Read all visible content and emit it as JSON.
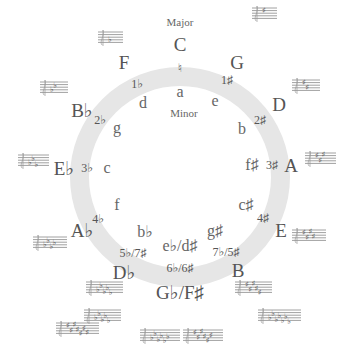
{
  "diagram": {
    "captions": {
      "major": "Major",
      "minor": "Minor"
    },
    "ring": {
      "color": "#e6e6e6",
      "cx": 180,
      "cy": 177,
      "r_outer": 110,
      "r_inner": 91
    },
    "keys": [
      {
        "id": "C",
        "major": "C",
        "minor": "a",
        "signature": "♮",
        "major_pos": [
          180,
          44
        ],
        "minor_pos": [
          180,
          92
        ],
        "sig_pos": [
          180,
          68
        ],
        "staff_pos": null,
        "accidentals": 0,
        "type": "natural"
      },
      {
        "id": "G",
        "major": "G",
        "minor": "e",
        "signature": "1♯",
        "major_pos": [
          237,
          62
        ],
        "minor_pos": [
          215,
          101
        ],
        "sig_pos": [
          227,
          80
        ],
        "staff_pos": [
          252,
          8
        ],
        "accidentals": 1,
        "type": "sharp"
      },
      {
        "id": "D",
        "major": "D",
        "minor": "b",
        "signature": "2♯",
        "major_pos": [
          279,
          104
        ],
        "minor_pos": [
          242,
          129
        ],
        "sig_pos": [
          260,
          120
        ],
        "staff_pos": [
          292,
          80
        ],
        "accidentals": 2,
        "type": "sharp"
      },
      {
        "id": "A",
        "major": "A",
        "minor": "f♯",
        "signature": "3♯",
        "major_pos": [
          291,
          165
        ],
        "minor_pos": [
          252,
          165
        ],
        "sig_pos": [
          272,
          165
        ],
        "staff_pos": [
          305,
          153
        ],
        "accidentals": 3,
        "type": "sharp"
      },
      {
        "id": "E",
        "major": "E",
        "minor": "c♯",
        "signature": "4♯",
        "major_pos": [
          281,
          230
        ],
        "minor_pos": [
          246,
          205
        ],
        "sig_pos": [
          263,
          218
        ],
        "staff_pos": [
          292,
          230
        ],
        "accidentals": 4,
        "type": "sharp"
      },
      {
        "id": "B",
        "major": "B",
        "minor": "g♯",
        "signature": "7♭/5♯",
        "major_pos": [
          238,
          270
        ],
        "minor_pos": [
          215,
          231
        ],
        "sig_pos": [
          226,
          252
        ],
        "staff_pos": [
          235,
          282
        ],
        "accidentals": 5,
        "type": "sharp"
      },
      {
        "id": "Gb",
        "major": "G♭/F♯",
        "minor": "e♭/d♯",
        "signature": "6♭/6♯",
        "major_pos": [
          180,
          292
        ],
        "minor_pos": [
          180,
          246
        ],
        "sig_pos": [
          180,
          268
        ],
        "staff_pos": null,
        "accidentals": 6,
        "type": "both"
      },
      {
        "id": "Db",
        "major": "D♭",
        "minor": "b♭",
        "signature": "5♭/7♯",
        "major_pos": [
          124,
          272
        ],
        "minor_pos": [
          145,
          232
        ],
        "sig_pos": [
          133,
          253
        ],
        "staff_pos": [
          86,
          282
        ],
        "accidentals": 5,
        "type": "flat"
      },
      {
        "id": "Ab",
        "major": "A♭",
        "minor": "f",
        "signature": "4♭",
        "major_pos": [
          82,
          230
        ],
        "minor_pos": [
          117,
          205
        ],
        "sig_pos": [
          98,
          219
        ],
        "staff_pos": [
          33,
          237
        ],
        "accidentals": 4,
        "type": "flat"
      },
      {
        "id": "Eb",
        "major": "E♭",
        "minor": "c",
        "signature": "3♭",
        "major_pos": [
          64,
          168
        ],
        "minor_pos": [
          107,
          168
        ],
        "sig_pos": [
          87,
          168
        ],
        "staff_pos": [
          18,
          155
        ],
        "accidentals": 3,
        "type": "flat"
      },
      {
        "id": "Bb",
        "major": "B♭",
        "minor": "g",
        "signature": "2♭",
        "major_pos": [
          82,
          110
        ],
        "minor_pos": [
          117,
          128
        ],
        "sig_pos": [
          100,
          120
        ],
        "staff_pos": [
          40,
          82
        ],
        "accidentals": 2,
        "type": "flat"
      },
      {
        "id": "F",
        "major": "F",
        "minor": "d",
        "signature": "1♭",
        "major_pos": [
          124,
          62
        ],
        "minor_pos": [
          143,
          103
        ],
        "sig_pos": [
          137,
          84
        ],
        "staff_pos": [
          98,
          32
        ],
        "accidentals": 1,
        "type": "flat"
      }
    ],
    "extra_staves": [
      {
        "label": "D♭ major signature (5 flats)",
        "pos": [
          84,
          320
        ],
        "accidentals": 5,
        "type": "flat"
      },
      {
        "label": "C♯ major signature (7 sharps)",
        "pos": [
          56,
          333
        ],
        "accidentals": 7,
        "type": "sharp"
      },
      {
        "label": "G♭ major signature (6 flats)",
        "pos": [
          140,
          340
        ],
        "accidentals": 6,
        "type": "flat"
      },
      {
        "label": "F♯ major signature (6 sharps)",
        "pos": [
          183,
          340
        ],
        "accidentals": 6,
        "type": "sharp"
      },
      {
        "label": "C♭ major signature (7 flats)",
        "pos": [
          258,
          320
        ],
        "accidentals": 7,
        "type": "flat"
      }
    ]
  }
}
